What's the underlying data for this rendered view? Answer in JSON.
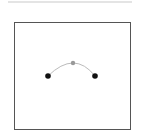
{
  "diagram": {
    "type": "bezier-curve",
    "frame": {
      "x": 14,
      "y": 22,
      "width": 117,
      "height": 108,
      "border_color": "#555555"
    },
    "curve": {
      "stroke_color": "#bbbbbb",
      "stroke_width": 1
    },
    "points": [
      {
        "role": "anchor-start",
        "x": 48,
        "y": 76,
        "color": "#111111",
        "radius": 2.8
      },
      {
        "role": "control",
        "x": 73,
        "y": 63,
        "color": "#999999",
        "radius": 2.2
      },
      {
        "role": "anchor-end",
        "x": 95,
        "y": 76,
        "color": "#111111",
        "radius": 2.8
      }
    ]
  },
  "colors": {
    "top_bar": "#e4e4e4",
    "background": "#ffffff"
  }
}
